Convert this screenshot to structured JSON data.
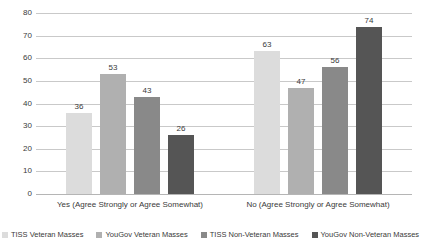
{
  "chart_data": {
    "type": "bar",
    "title": "Masses",
    "xlabel": "",
    "ylabel": "",
    "ylim": [
      0,
      80
    ],
    "yticks": [
      0,
      10,
      20,
      30,
      40,
      50,
      60,
      70,
      80
    ],
    "grid": "horizontal",
    "legend_position": "bottom",
    "data_labels": true,
    "categories": [
      "Yes (Agree Strongly or Agree Somewhat)",
      "No (Agree Strongly or Agree Somewhat)"
    ],
    "series": [
      {
        "name": "TISS Veteran Masses",
        "color": "#dcdcdc",
        "values": [
          36,
          63
        ]
      },
      {
        "name": "YouGov Veteran Masses",
        "color": "#b0b0b0",
        "values": [
          53,
          47
        ]
      },
      {
        "name": "TISS Non-Veteran Masses",
        "color": "#898989",
        "values": [
          43,
          56
        ]
      },
      {
        "name": "YouGov Non-Veteran Masses",
        "color": "#555555",
        "values": [
          26,
          74
        ]
      }
    ]
  },
  "axis": {
    "ticks": [
      "80",
      "70",
      "60",
      "50",
      "40",
      "30",
      "20",
      "10",
      "0"
    ]
  },
  "groups": [
    {
      "label": "Yes (Agree Strongly or Agree Somewhat)",
      "bars": [
        {
          "value": "36",
          "series": "TISS Veteran Masses"
        },
        {
          "value": "53",
          "series": "YouGov Veteran Masses"
        },
        {
          "value": "43",
          "series": "TISS Non-Veteran Masses"
        },
        {
          "value": "26",
          "series": "YouGov Non-Veteran Masses"
        }
      ]
    },
    {
      "label": "No (Agree Strongly or Agree Somewhat)",
      "bars": [
        {
          "value": "63",
          "series": "TISS Veteran Masses"
        },
        {
          "value": "47",
          "series": "YouGov Veteran Masses"
        },
        {
          "value": "56",
          "series": "TISS Non-Veteran Masses"
        },
        {
          "value": "74",
          "series": "YouGov Non-Veteran Masses"
        }
      ]
    }
  ],
  "legend": [
    {
      "label": "TISS Veteran Masses"
    },
    {
      "label": "YouGov Veteran Masses"
    },
    {
      "label": "TISS Non-Veteran Masses"
    },
    {
      "label": "YouGov Non-Veteran Masses"
    }
  ]
}
